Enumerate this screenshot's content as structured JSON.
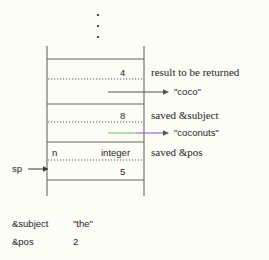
{
  "diagram": {
    "ellipsis": "⋮",
    "stack": {
      "slots": [
        {
          "id": "result-slot",
          "value": "4",
          "annotation": "result to be returned",
          "pointer_target": "\"coco\""
        },
        {
          "id": "saved-subject-slot",
          "value": "8",
          "annotation": "saved &subject",
          "pointer_target": "\"coconuts\""
        },
        {
          "id": "saved-pos-slot",
          "name": "n",
          "type": "integer",
          "value": "5",
          "annotation": "saved &pos"
        }
      ]
    },
    "sp_label": "sp",
    "variables": [
      {
        "name": "&subject",
        "value": "\"the\""
      },
      {
        "name": "&pos",
        "value": "2"
      }
    ],
    "colors": {
      "ink": "#262420",
      "rule": "#6b675e",
      "dotted": "#5b574e",
      "green": "#7fd67f",
      "purple": "#9a77d6",
      "background": "#fdfdf8"
    }
  }
}
